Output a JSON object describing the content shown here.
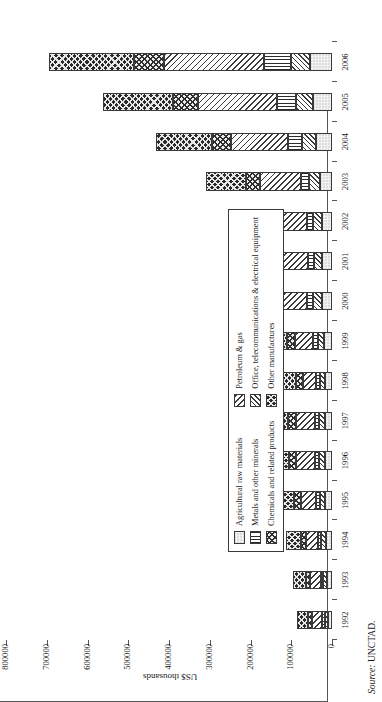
{
  "source_note": {
    "prefix": "Source:",
    "value": "UNCTAD."
  },
  "axis": {
    "value_title": "US$ thousands",
    "value_ticks": [
      "0",
      "100000",
      "200000",
      "300000",
      "400000",
      "500000",
      "600000",
      "700000",
      "800000"
    ],
    "value_max": 800000,
    "value_step": 100000
  },
  "legend": {
    "column_left": [
      {
        "key": "agricultural",
        "label": "Agricultural raw materials",
        "swatch": "p-agri"
      },
      {
        "key": "metals",
        "label": "Metals and other minerals",
        "swatch": "p-metals"
      },
      {
        "key": "chemicals",
        "label": "Chemicals and related products",
        "swatch": "p-chem"
      }
    ],
    "column_right": [
      {
        "key": "petroleum",
        "label": "Petroleum & gas",
        "swatch": "p-petro"
      },
      {
        "key": "office",
        "label": "Office, telecommunications & electrical equipment",
        "swatch": "p-office"
      },
      {
        "key": "other",
        "label": "Other manufactures",
        "swatch": "p-other"
      }
    ]
  },
  "chart_data": {
    "type": "bar",
    "title": "",
    "subtitle": "",
    "orientation": "horizontal-stacked",
    "stacked": true,
    "grid": false,
    "legend_position": "inside-left",
    "xlabel": "",
    "ylabel": "US$ thousands",
    "ylim": [
      0,
      800000
    ],
    "ytick_values": [
      0,
      100000,
      200000,
      300000,
      400000,
      500000,
      600000,
      700000,
      800000
    ],
    "categories": [
      "1992",
      "1993",
      "1994",
      "1995",
      "1996",
      "1997",
      "1998",
      "1999",
      "2000",
      "2001",
      "2002",
      "2003",
      "2004",
      "2005",
      "2006"
    ],
    "series": [
      {
        "name": "Agricultural raw materials",
        "pattern": "p-agri",
        "values": [
          11000,
          13000,
          15000,
          16000,
          17000,
          17000,
          16000,
          19000,
          24000,
          24000,
          25000,
          30000,
          39000,
          47000,
          53000
        ]
      },
      {
        "name": "Office, telecommunications & electrical equipment",
        "pattern": "p-office",
        "values": [
          7000,
          8000,
          11000,
          13000,
          14000,
          15000,
          14000,
          16000,
          22000,
          20000,
          22000,
          26000,
          34000,
          41000,
          47000
        ]
      },
      {
        "name": "Metals and other minerals",
        "pattern": "p-metals",
        "values": [
          6000,
          7000,
          9000,
          11000,
          11000,
          11000,
          10000,
          11000,
          15000,
          14000,
          15000,
          20000,
          34000,
          46000,
          68000
        ]
      },
      {
        "name": "Petroleum & gas",
        "pattern": "p-petro",
        "values": [
          25000,
          26000,
          28000,
          36000,
          46000,
          46000,
          32000,
          46000,
          78000,
          73000,
          78000,
          100000,
          140000,
          196000,
          245000
        ]
      },
      {
        "name": "Chemicals and related products",
        "pattern": "p-chem",
        "values": [
          10000,
          11000,
          13000,
          17000,
          17000,
          18000,
          17000,
          19000,
          26000,
          26000,
          28000,
          36000,
          48000,
          61000,
          73000
        ]
      },
      {
        "name": "Other manufactures",
        "pattern": "p-other",
        "values": [
          26000,
          30000,
          37000,
          45000,
          48000,
          50000,
          45000,
          50000,
          67000,
          69000,
          75000,
          97000,
          136000,
          170000,
          208000
        ]
      }
    ]
  }
}
